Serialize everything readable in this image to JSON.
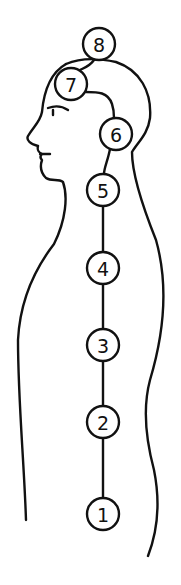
{
  "diagram": {
    "title": "",
    "line_color": "#111111",
    "background": "#ffffff",
    "nodes": [
      {
        "label": "1",
        "cx": 103,
        "cy": 514,
        "r": 16
      },
      {
        "label": "2",
        "cx": 103,
        "cy": 422,
        "r": 16
      },
      {
        "label": "3",
        "cx": 103,
        "cy": 345,
        "r": 16
      },
      {
        "label": "4",
        "cx": 103,
        "cy": 268,
        "r": 16
      },
      {
        "label": "5",
        "cx": 103,
        "cy": 190,
        "r": 16
      },
      {
        "label": "6",
        "cx": 116,
        "cy": 134,
        "r": 16
      },
      {
        "label": "7",
        "cx": 71,
        "cy": 84,
        "r": 16
      },
      {
        "label": "8",
        "cx": 99,
        "cy": 44,
        "r": 16
      }
    ]
  }
}
